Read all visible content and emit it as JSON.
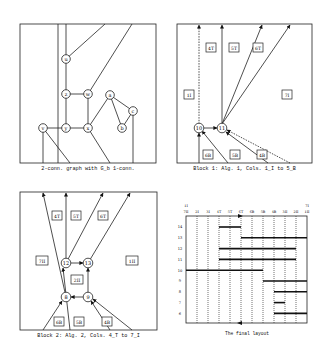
{
  "panels": {
    "graph": {
      "caption": "2-conn. graph with G_b 1-conn.",
      "nodes": [
        "u",
        "z",
        "w",
        "a",
        "c",
        "b",
        "v",
        "y",
        "x"
      ]
    },
    "block1": {
      "caption": "Block 1: Alg. 1, Cols. 1_I to 5_B",
      "nodes": [
        "10",
        "11"
      ],
      "faces": [
        "4_T",
        "5_T",
        "6_T",
        "1_I",
        "7_I",
        "6_B",
        "5_B",
        "4_B"
      ]
    },
    "block2": {
      "caption": "Block 2: Alg. 2, Cols. 4_T to 7_I",
      "nodes": [
        "12",
        "13",
        "8",
        "9"
      ],
      "faces": [
        "4_T",
        "5_T",
        "6_T",
        "7_II",
        "1_II",
        "2_II",
        "6_B",
        "5_B",
        "4_B"
      ]
    },
    "layout": {
      "caption": "The final layout",
      "top_left_label": "1_I",
      "top_right_label": "7_I",
      "columns": [
        "7_II",
        "2_I",
        "3_I",
        "4_T",
        "5_T",
        "6_T",
        "6_B",
        "5_B",
        "4_B",
        "3_II",
        "2_II",
        "1_II"
      ],
      "rows": [
        "14",
        "13",
        "12",
        "11",
        "10",
        "9",
        "8",
        "7",
        "6"
      ],
      "bars": [
        {
          "row": "14",
          "from": 3,
          "to": 5
        },
        {
          "row": "13",
          "from": 5,
          "to": 11
        },
        {
          "row": "12",
          "from": 3,
          "to": 10
        },
        {
          "row": "11",
          "from": 3,
          "to": 10
        },
        {
          "row": "10",
          "from": 0,
          "to": 7
        },
        {
          "row": "9",
          "from": 7,
          "to": 11
        },
        {
          "row": "8",
          "from": 8,
          "to": 11
        },
        {
          "row": "7",
          "from": 8,
          "to": 9
        },
        {
          "row": "6",
          "from": 8,
          "to": 11
        }
      ]
    }
  }
}
